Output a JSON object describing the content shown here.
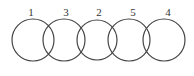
{
  "diagram": {
    "circles": [
      {
        "label": "1",
        "cx": 33,
        "cy": 40,
        "r": 21
      },
      {
        "label": "3",
        "cx": 64,
        "cy": 40,
        "r": 21
      },
      {
        "label": "2",
        "cx": 97,
        "cy": 40,
        "r": 20
      },
      {
        "label": "5",
        "cx": 129,
        "cy": 40,
        "r": 21
      },
      {
        "label": "4",
        "cx": 164,
        "cy": 40,
        "r": 21
      }
    ],
    "stroke_color": "#444444"
  }
}
